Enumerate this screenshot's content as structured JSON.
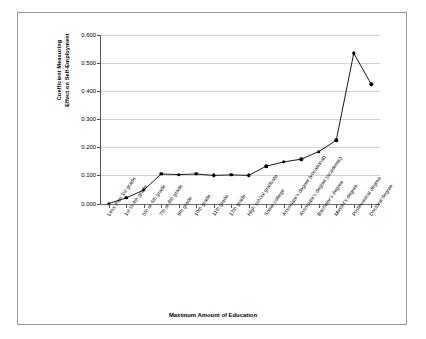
{
  "chart_data": {
    "type": "line",
    "title": "",
    "xlabel": "Maximum Amount of Education",
    "ylabel_line1": "Coefficient Measuring",
    "ylabel_line2": "Effect on Self-Employment",
    "categories": [
      "Less than 1st grade",
      "1st to 4th grade",
      "5th or 6th grade",
      "7th or 8th grade",
      "9th grade",
      "10th grade",
      "11th grade",
      "12th grade",
      "High school graduate",
      "Some college",
      "Associate's degree (vocational)",
      "Associate's degree (academic)",
      "Bachelor's degree",
      "Master's degree",
      "Professional degree",
      "Doctoral degree"
    ],
    "values": [
      0.0,
      0.02,
      0.048,
      0.105,
      0.103,
      0.105,
      0.1,
      0.102,
      0.1,
      0.133,
      0.148,
      0.158,
      0.185,
      0.225,
      0.535,
      0.425
    ],
    "ylim": [
      0.0,
      0.6
    ],
    "yticks": [
      "0.000",
      "0.100",
      "0.200",
      "0.300",
      "0.400",
      "0.500",
      "0.600"
    ],
    "ytick_values": [
      0.0,
      0.1,
      0.2,
      0.3,
      0.4,
      0.5,
      0.6
    ],
    "grid": true,
    "legend": "none",
    "marker": "filled-diamond",
    "line_color": "#000000",
    "marker_color": "#000000",
    "grid_color": "#d2d2d2",
    "axis_color": "#555555",
    "frame_color": "#9b9b9b",
    "background": "#ffffff"
  }
}
